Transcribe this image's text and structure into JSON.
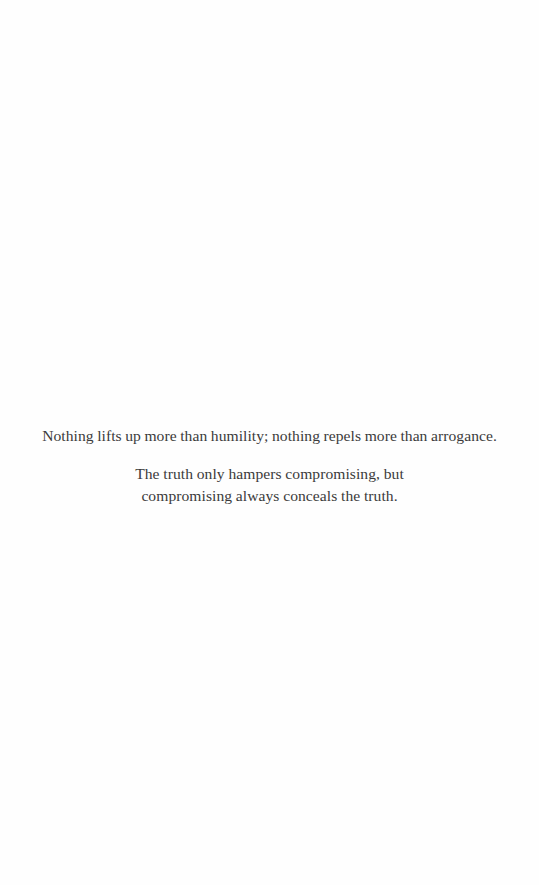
{
  "page": {
    "background_color": "#fefefe",
    "text_color": "#3b3b3b"
  },
  "quotes": [
    {
      "lines": [
        "Nothing lifts up more than humility; nothing repels more than arrogance."
      ]
    },
    {
      "lines": [
        "The truth only hampers compromising, but",
        "compromising always conceals the truth."
      ]
    }
  ]
}
